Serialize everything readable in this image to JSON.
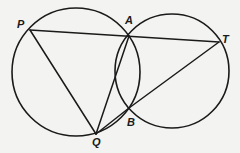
{
  "diagram": {
    "type": "geometry",
    "colors": {
      "background": "#f3f3f1",
      "stroke": "#1a1a1a"
    },
    "circles": [
      {
        "id": "left-circle",
        "cx": 76,
        "cy": 72,
        "r": 64
      },
      {
        "id": "right-circle",
        "cx": 172,
        "cy": 71,
        "r": 57
      }
    ],
    "points": {
      "P": {
        "x": 30,
        "y": 30,
        "label": "P",
        "lx": 17,
        "ly": 28
      },
      "A": {
        "x": 129,
        "y": 36,
        "label": "A",
        "lx": 125,
        "ly": 24
      },
      "T": {
        "x": 219,
        "y": 42,
        "label": "T",
        "lx": 222,
        "ly": 43
      },
      "B": {
        "x": 129,
        "y": 108,
        "label": "B",
        "lx": 127,
        "ly": 126
      },
      "Q": {
        "x": 96,
        "y": 134,
        "label": "Q",
        "lx": 92,
        "ly": 146
      }
    },
    "segments": [
      {
        "from": "P",
        "to": "T"
      },
      {
        "from": "P",
        "to": "Q"
      },
      {
        "from": "Q",
        "to": "A"
      },
      {
        "from": "Q",
        "to": "B"
      },
      {
        "from": "B",
        "to": "T"
      }
    ]
  }
}
